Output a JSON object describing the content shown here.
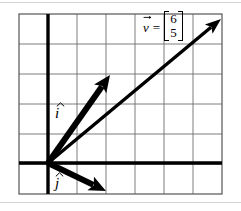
{
  "figure": {
    "type": "vector-diagram",
    "background_color": "#ffffff",
    "grid": {
      "columns": 7,
      "rows": 6,
      "line_color": "#6e6e6e",
      "border_color": "#555555",
      "left": 19,
      "top": 14,
      "cell_width": 29,
      "cell_height": 30
    },
    "axes": {
      "color": "#000000",
      "thickness": 3.4,
      "origin_x": 48,
      "origin_y": 163,
      "x_axis_label": "",
      "y_axis_label": ""
    },
    "annotation": {
      "vector_name": "v",
      "equals": "=",
      "matrix_values": [
        "6",
        "5"
      ],
      "bracket_style": "square"
    },
    "labels": {
      "i_hat": "i",
      "j_hat": "j"
    },
    "vectors": [
      {
        "name": "i-hat",
        "label": "i",
        "from": [
          48,
          163
        ],
        "to": [
          110,
          75
        ],
        "color": "#000000",
        "stroke": 6,
        "head_length": 17,
        "head_width": 15
      },
      {
        "name": "j-hat",
        "label": "j",
        "from": [
          48,
          163
        ],
        "to": [
          106,
          191
        ],
        "color": "#000000",
        "stroke": 6,
        "head_length": 17,
        "head_width": 15
      },
      {
        "name": "v",
        "label": "v",
        "from": [
          48,
          163
        ],
        "to": [
          221,
          19
        ],
        "color": "#000000",
        "stroke": 3.4,
        "head_length": 16,
        "head_width": 12
      }
    ]
  }
}
